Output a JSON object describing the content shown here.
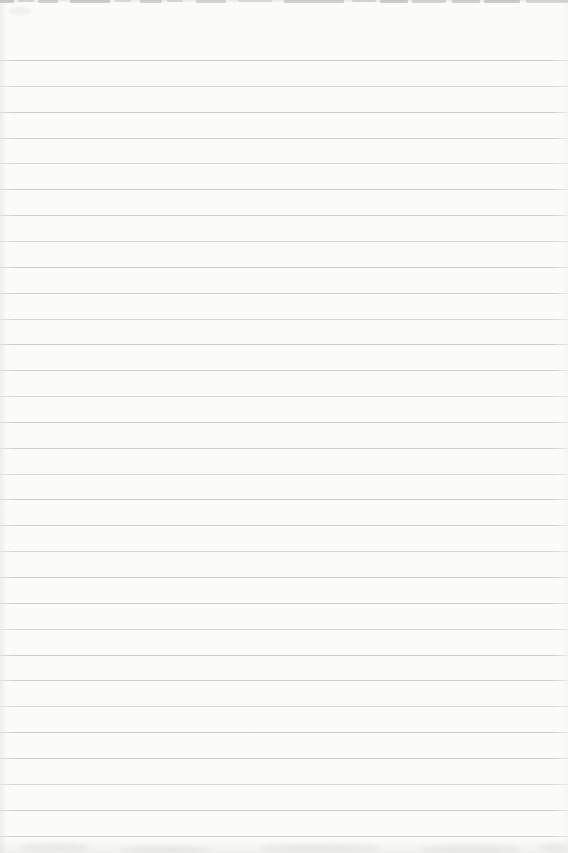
{
  "page": {
    "kind": "blank-ruled-notebook-page",
    "width_px": 568,
    "height_px": 853,
    "background_color": "#fbfbfa",
    "text_content": ""
  },
  "ruling": {
    "line_count": 31,
    "first_line_y": 60,
    "line_spacing": 25.85,
    "line_thickness_px": 1,
    "line_color": "#c6c8c5",
    "line_opacities": [
      0.85,
      0.7,
      0.9
    ]
  },
  "scan_artifacts": {
    "top_edge_smudge_color": "#8f8f8c",
    "top_edge_smudges": [
      {
        "x": 0,
        "w": 14,
        "h": 3,
        "opacity": 0.4
      },
      {
        "x": 18,
        "w": 16,
        "h": 2,
        "opacity": 0.28
      },
      {
        "x": 38,
        "w": 20,
        "h": 3,
        "opacity": 0.36
      },
      {
        "x": 70,
        "w": 40,
        "h": 3,
        "opacity": 0.4
      },
      {
        "x": 115,
        "w": 16,
        "h": 2,
        "opacity": 0.24
      },
      {
        "x": 140,
        "w": 22,
        "h": 3,
        "opacity": 0.36
      },
      {
        "x": 167,
        "w": 16,
        "h": 2,
        "opacity": 0.28
      },
      {
        "x": 196,
        "w": 30,
        "h": 3,
        "opacity": 0.32
      },
      {
        "x": 238,
        "w": 34,
        "h": 2,
        "opacity": 0.24
      },
      {
        "x": 284,
        "w": 60,
        "h": 3,
        "opacity": 0.36
      },
      {
        "x": 352,
        "w": 24,
        "h": 2,
        "opacity": 0.28
      },
      {
        "x": 380,
        "w": 28,
        "h": 3,
        "opacity": 0.4
      },
      {
        "x": 412,
        "w": 34,
        "h": 3,
        "opacity": 0.32
      },
      {
        "x": 452,
        "w": 28,
        "h": 3,
        "opacity": 0.36
      },
      {
        "x": 484,
        "w": 36,
        "h": 3,
        "opacity": 0.4
      },
      {
        "x": 526,
        "w": 42,
        "h": 3,
        "opacity": 0.3
      }
    ],
    "bottom_edge_blobs": [
      {
        "x": 20,
        "y": 843,
        "w": 70,
        "h": 8
      },
      {
        "x": 120,
        "y": 846,
        "w": 90,
        "h": 7
      },
      {
        "x": 260,
        "y": 844,
        "w": 120,
        "h": 8
      },
      {
        "x": 420,
        "y": 845,
        "w": 100,
        "h": 8
      },
      {
        "x": 538,
        "y": 843,
        "w": 30,
        "h": 8
      }
    ]
  }
}
